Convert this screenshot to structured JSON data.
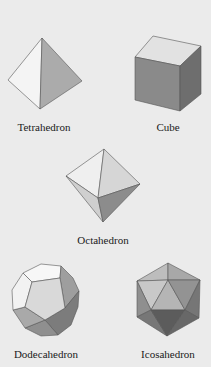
{
  "figure": {
    "background": "#ebebeb",
    "solids": [
      {
        "name": "Tetrahedron",
        "label": "Tetrahedron",
        "label_pos": [
          44,
          121
        ],
        "faces": [
          {
            "points": "42,38 8,80 40,109",
            "fill": "#f4f4f4"
          },
          {
            "points": "42,38 40,109 82,81",
            "fill": "#ababab"
          }
        ]
      },
      {
        "name": "Cube",
        "label": "Cube",
        "label_pos": [
          168,
          121
        ],
        "faces": [
          {
            "points": "153,36 201,46 180,66 135,57",
            "fill": "#e2e2e2"
          },
          {
            "points": "135,57 180,66 180,111 135,100",
            "fill": "#8a8a8a"
          },
          {
            "points": "180,66 201,46 201,94 180,111",
            "fill": "#6e6e6e"
          }
        ]
      },
      {
        "name": "Octahedron",
        "label": "Octahedron",
        "label_pos": [
          103,
          234
        ],
        "faces": [
          {
            "points": "104,149 66,176 98,198",
            "fill": "#efefef"
          },
          {
            "points": "104,149 98,198 140,184",
            "fill": "#d6d6d6"
          },
          {
            "points": "66,176 98,198 103,222",
            "fill": "#cfcfcf"
          },
          {
            "points": "98,198 140,184 103,222",
            "fill": "#8c8c8c"
          }
        ]
      },
      {
        "name": "Dodecahedron",
        "label": "Dodecahedron",
        "label_pos": [
          46,
          348
        ],
        "faces": [
          {
            "points": "23,273 41,264 61,266 60,278 32,282",
            "fill": "#f7f7f7"
          },
          {
            "points": "61,266 73,278 79,291 65,308 60,278",
            "fill": "#9e9e9e"
          },
          {
            "points": "79,291 78,307 71,325 58,335 45,320 65,308",
            "fill": "#7c7c7c"
          },
          {
            "points": "58,335 41,336 25,328 45,320",
            "fill": "#8f8f8f"
          },
          {
            "points": "25,328 13,310 25,307 45,320",
            "fill": "#a9a9a9"
          },
          {
            "points": "13,310 12,290 23,273 32,282 25,307",
            "fill": "#f2f2f2"
          },
          {
            "points": "32,282 60,278 65,308 45,320 25,307",
            "fill": "#d9d9d9"
          }
        ]
      },
      {
        "name": "Icosahedron",
        "label": "Icosahedron",
        "label_pos": [
          168,
          348
        ],
        "faces": [
          {
            "points": "168,263 137,281 168,280",
            "fill": "#bdbdbd"
          },
          {
            "points": "168,263 168,280 200,280",
            "fill": "#a8a8a8"
          },
          {
            "points": "137,281 168,280 151,310",
            "fill": "#c8c8c8"
          },
          {
            "points": "168,280 151,310 185,310",
            "fill": "#b5b5b5"
          },
          {
            "points": "168,280 185,310 200,280",
            "fill": "#939393"
          },
          {
            "points": "137,281 151,310 137,317",
            "fill": "#8f8f8f"
          },
          {
            "points": "200,280 185,310 199,318",
            "fill": "#767676"
          },
          {
            "points": "151,310 137,317 167,336",
            "fill": "#777777"
          },
          {
            "points": "151,310 185,310 167,336",
            "fill": "#5c5c5c"
          },
          {
            "points": "185,310 167,336 199,318",
            "fill": "#686868"
          }
        ]
      }
    ]
  }
}
